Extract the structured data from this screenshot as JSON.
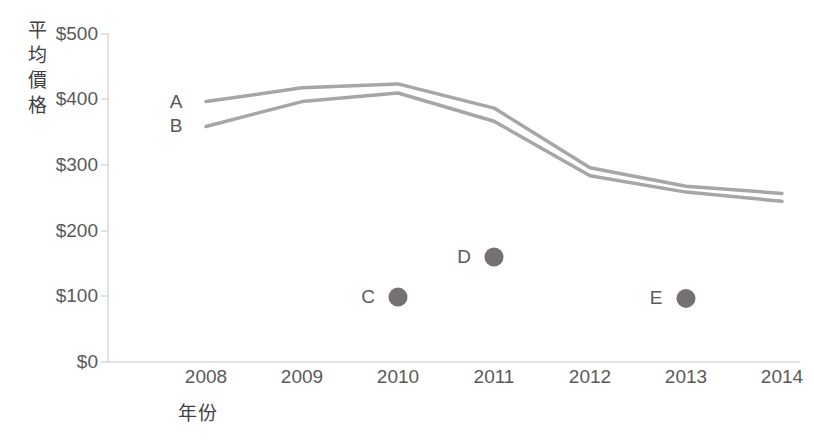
{
  "chart_data": {
    "type": "line",
    "title": "",
    "xlabel": "年份",
    "ylabel": "平均價格",
    "ylabel_chars": [
      "平",
      "均",
      "價",
      "格"
    ],
    "x": [
      2008,
      2009,
      2010,
      2011,
      2012,
      2013,
      2014
    ],
    "xtick_labels": [
      "2008",
      "2009",
      "2010",
      "2011",
      "2012",
      "2013",
      "2014"
    ],
    "ytick_labels": [
      "$0",
      "$100",
      "$200",
      "$300",
      "$400",
      "$500"
    ],
    "ytick_values": [
      0,
      100,
      200,
      300,
      400,
      500
    ],
    "ylim": [
      0,
      500
    ],
    "xlim": [
      2008,
      2014
    ],
    "grid": false,
    "legend": "inline-labels",
    "series": [
      {
        "name": "A",
        "label": "A",
        "color": "#a6a6a6",
        "values": [
          397,
          418,
          424,
          387,
          296,
          268,
          257
        ]
      },
      {
        "name": "B",
        "label": "B",
        "color": "#a6a6a6",
        "values": [
          359,
          397,
          410,
          367,
          284,
          259,
          245
        ]
      }
    ],
    "points": [
      {
        "label": "C",
        "x": 2010,
        "y": 99,
        "color": "#767171"
      },
      {
        "label": "D",
        "x": 2011,
        "y": 160,
        "color": "#767171"
      },
      {
        "label": "E",
        "x": 2013,
        "y": 97,
        "color": "#767171"
      }
    ],
    "axis_color": "#d9d9d9",
    "text_color": "#595959"
  }
}
